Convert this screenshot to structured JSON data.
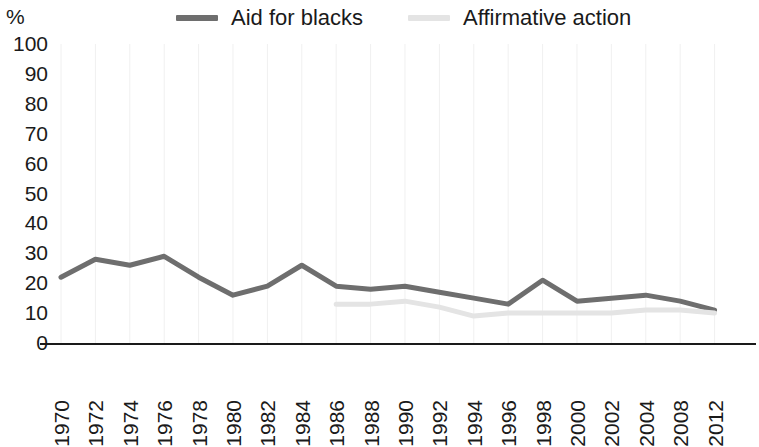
{
  "axis": {
    "y_unit_label": "%",
    "y_ticks": [
      "100",
      "90",
      "80",
      "70",
      "60",
      "50",
      "40",
      "30",
      "20",
      "10",
      "0"
    ]
  },
  "legend": {
    "items": [
      {
        "label": "Aid for blacks",
        "color": "#6e6e6e",
        "swatch_name": "legend-swatch-aid-for-blacks"
      },
      {
        "label": "Affirmative action",
        "color": "#e4e4e4",
        "swatch_name": "legend-swatch-affirmative-action"
      }
    ]
  },
  "colors": {
    "series_aid_for_blacks": "#6e6e6e",
    "series_affirmative_action": "#e4e4e4",
    "axis": "#1a1a1a",
    "gridline": "#f0f0f0",
    "text": "#1a1a1a",
    "background": "#ffffff"
  },
  "chart_data": {
    "type": "line",
    "title": "",
    "subtitle": "",
    "xlabel": "",
    "ylabel": "%",
    "ylim": [
      0,
      100
    ],
    "ytick_step": 10,
    "grid": "vertical-only",
    "legend_position": "top",
    "categories": [
      "1970",
      "1972",
      "1974",
      "1976",
      "1978",
      "1980",
      "1982",
      "1984",
      "1986",
      "1988",
      "1990",
      "1992",
      "1994",
      "1996",
      "1998",
      "2000",
      "2002",
      "2004",
      "2008",
      "2012"
    ],
    "series": [
      {
        "name": "Aid for blacks",
        "color": "#6e6e6e",
        "values": [
          22,
          28,
          26,
          29,
          22,
          16,
          19,
          26,
          19,
          18,
          19,
          17,
          15,
          13,
          21,
          14,
          15,
          16,
          14,
          11
        ]
      },
      {
        "name": "Affirmative action",
        "color": "#e4e4e4",
        "values": [
          null,
          null,
          null,
          null,
          null,
          null,
          null,
          null,
          13,
          13,
          14,
          12,
          9,
          10,
          10,
          10,
          10,
          11,
          11,
          10
        ]
      }
    ]
  }
}
